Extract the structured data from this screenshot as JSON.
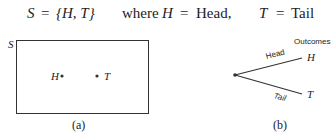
{
  "equation": {
    "lhs": "S",
    "eq1": "=",
    "set": "{H, T}",
    "where": "where",
    "h": "H",
    "eq2": "=",
    "head": "Head,",
    "t": "T",
    "eq3": "=",
    "tail": "Tail"
  },
  "panel_a": {
    "set_label": "S",
    "point_h": "H",
    "point_t": "T",
    "caption": "(a)"
  },
  "panel_b": {
    "header": "Outcomes",
    "branch_top": "Head",
    "branch_bottom": "Tail",
    "outcome_top": "H",
    "outcome_bottom": "T",
    "caption": "(b)"
  }
}
